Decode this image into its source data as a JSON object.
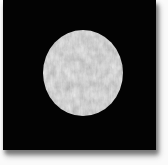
{
  "image": {
    "description": "Grainy light-gray disc centered on a black square photo, scanned onto white paper with a soft gray shadow along the bottom and right edges",
    "colors": {
      "background": "#030303",
      "paper": "#fafafa",
      "disc_mid_gray": "#9d9d9d",
      "shadow_gray": "#767676"
    },
    "disc": {
      "center_x": 83,
      "center_y": 73,
      "radius_x": 40,
      "radius_y": 43
    }
  }
}
